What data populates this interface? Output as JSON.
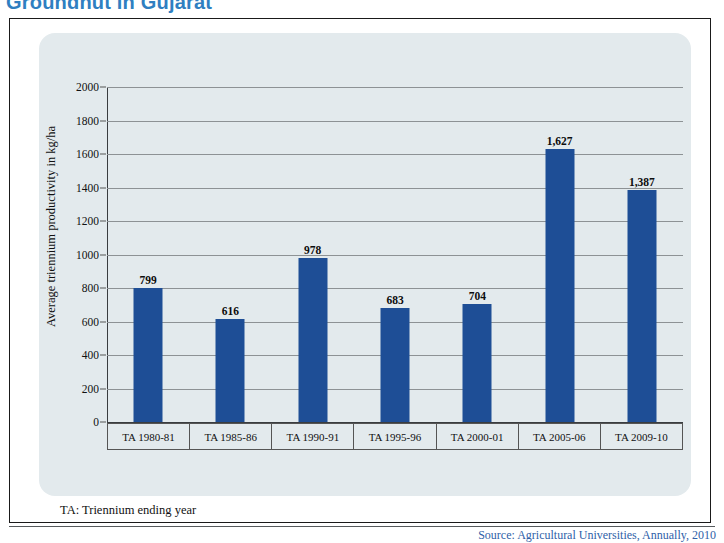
{
  "page": {
    "title": "Groundnut in Gujarat",
    "title_color": "#2f7fc1",
    "footnote": "TA: Triennium ending year",
    "source": "Source: Agricultural Universities, Annually, 2010"
  },
  "chart_data": {
    "type": "bar",
    "title": "Groundnut in Gujarat",
    "xlabel": "",
    "ylabel": "Average triennium productivity in kg/ha",
    "categories": [
      "TA 1980-81",
      "TA 1985-86",
      "TA 1990-91",
      "TA 1995-96",
      "TA 2000-01",
      "TA 2005-06",
      "TA 2009-10"
    ],
    "values": [
      799,
      616,
      978,
      683,
      704,
      1627,
      1387
    ],
    "value_labels": [
      "799",
      "616",
      "978",
      "683",
      "704",
      "1,627",
      "1,387"
    ],
    "ylim": [
      0,
      2000
    ],
    "ytick_values": [
      0,
      200,
      400,
      600,
      800,
      1000,
      1200,
      1400,
      1600,
      1800,
      2000
    ],
    "ytick_labels": [
      "0",
      "200",
      "400",
      "600",
      "800",
      "1000",
      "1200",
      "1400",
      "1600",
      "1800",
      "2000"
    ],
    "grid": true,
    "legend": false,
    "bar_color": "#1e4e96",
    "panel_color": "#e3eaed",
    "gridline_color": "#8d9295"
  }
}
